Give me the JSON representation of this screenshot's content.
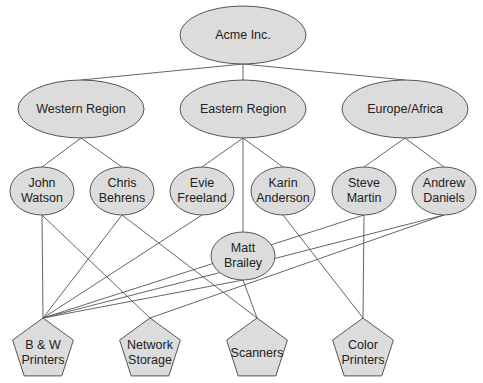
{
  "colors": {
    "node_fill": "#dcdcdc",
    "stroke": "#555555",
    "text": "#222222",
    "background": "#ffffff"
  },
  "nodes": {
    "root": {
      "label": "Acme Inc.",
      "shape": "ellipse",
      "x": 243,
      "y": 35,
      "rx": 63,
      "ry": 29
    },
    "western": {
      "label": "Western Region",
      "shape": "ellipse",
      "x": 81,
      "y": 109,
      "rx": 63,
      "ry": 29
    },
    "eastern": {
      "label": "Eastern Region",
      "shape": "ellipse",
      "x": 243,
      "y": 109,
      "rx": 63,
      "ry": 29
    },
    "europe": {
      "label": "Europe/Africa",
      "shape": "ellipse",
      "x": 405,
      "y": 109,
      "rx": 63,
      "ry": 29
    },
    "john": {
      "label": "John\nWatson",
      "shape": "ellipse",
      "x": 42,
      "y": 191,
      "rx": 32,
      "ry": 24
    },
    "chris": {
      "label": "Chris\nBehrens",
      "shape": "ellipse",
      "x": 122,
      "y": 191,
      "rx": 32,
      "ry": 24
    },
    "evie": {
      "label": "Evie\nFreeland",
      "shape": "ellipse",
      "x": 202,
      "y": 191,
      "rx": 32,
      "ry": 24
    },
    "karin": {
      "label": "Karin\nAnderson",
      "shape": "ellipse",
      "x": 283,
      "y": 191,
      "rx": 32,
      "ry": 24
    },
    "steve": {
      "label": "Steve\nMartin",
      "shape": "ellipse",
      "x": 364,
      "y": 191,
      "rx": 32,
      "ry": 24
    },
    "andrew": {
      "label": "Andrew\nDaniels",
      "shape": "ellipse",
      "x": 444,
      "y": 191,
      "rx": 32,
      "ry": 24
    },
    "matt": {
      "label": "Matt\nBrailey",
      "shape": "ellipse",
      "x": 243,
      "y": 256,
      "rx": 32,
      "ry": 24
    },
    "bw": {
      "label": "B & W\nPrinters",
      "shape": "pentagon",
      "x": 43,
      "y": 350,
      "r": 32
    },
    "network": {
      "label": "Network\nStorage",
      "shape": "pentagon",
      "x": 150,
      "y": 350,
      "r": 32
    },
    "scanners": {
      "label": "Scanners",
      "shape": "pentagon",
      "x": 257,
      "y": 350,
      "r": 32
    },
    "color": {
      "label": "Color\nPrinters",
      "shape": "pentagon",
      "x": 363,
      "y": 350,
      "r": 32
    }
  },
  "edges": [
    [
      "root",
      "western"
    ],
    [
      "root",
      "eastern"
    ],
    [
      "root",
      "europe"
    ],
    [
      "western",
      "john"
    ],
    [
      "western",
      "chris"
    ],
    [
      "eastern",
      "evie"
    ],
    [
      "eastern",
      "karin"
    ],
    [
      "eastern",
      "matt"
    ],
    [
      "europe",
      "steve"
    ],
    [
      "europe",
      "andrew"
    ],
    [
      "john",
      "bw"
    ],
    [
      "john",
      "network"
    ],
    [
      "chris",
      "bw"
    ],
    [
      "chris",
      "scanners"
    ],
    [
      "evie",
      "bw"
    ],
    [
      "karin",
      "color"
    ],
    [
      "matt",
      "bw"
    ],
    [
      "matt",
      "scanners"
    ],
    [
      "steve",
      "bw"
    ],
    [
      "steve",
      "color"
    ],
    [
      "andrew",
      "bw"
    ],
    [
      "andrew",
      "network"
    ]
  ]
}
